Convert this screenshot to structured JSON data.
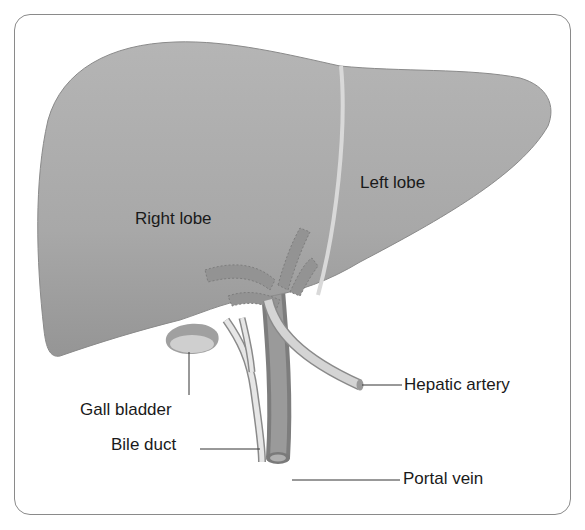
{
  "diagram": {
    "colors": {
      "liver": "#a9a9a9",
      "liver_shadow": "#8f8f8f",
      "ligament": "#d6d6d6",
      "vessel_dark": "#8c8c8c",
      "bile_duct": "#e4e4e4",
      "artery": "#cfcfcf",
      "frame": "#8a8a8a",
      "text": "#1a1a1a"
    },
    "labels": {
      "right_lobe": "Right lobe",
      "left_lobe": "Left lobe",
      "gall_bladder": "Gall bladder",
      "bile_duct": "Bile duct",
      "hepatic_artery": "Hepatic artery",
      "portal_vein": "Portal vein"
    }
  }
}
